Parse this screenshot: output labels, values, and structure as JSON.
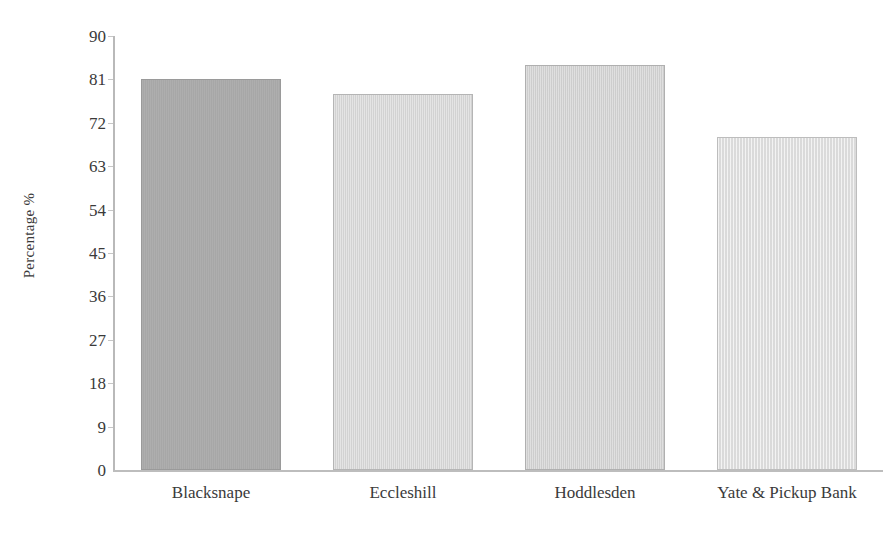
{
  "chart_data": {
    "type": "bar",
    "title": "",
    "subtitle": "",
    "xlabel": "",
    "ylabel": "Percentage %",
    "categories": [
      "Blacksnape",
      "Eccleshill",
      "Hoddlesden",
      "Yate & Pickup Bank"
    ],
    "values": [
      81,
      78,
      84,
      69
    ],
    "ylim": [
      0,
      90
    ],
    "ytick_values": [
      0,
      9,
      18,
      27,
      36,
      45,
      54,
      63,
      72,
      81,
      90
    ],
    "ytick_labels": [
      "0",
      "9",
      "18",
      "27",
      "36",
      "45",
      "54",
      "63",
      "72",
      "81",
      "90"
    ],
    "grid": false,
    "legend": false,
    "legend_position": "none",
    "bar_colors": [
      "#aaaaaa",
      "#d6d6d6",
      "#d2d2d2",
      "#e4e4e4"
    ],
    "bar_border_color": "#9a9a9a",
    "axis_color": "#bdbdbd",
    "text_color": "#3a3a3a",
    "background": "#ffffff"
  },
  "axis": {
    "y_label_text": "Percentage %"
  }
}
